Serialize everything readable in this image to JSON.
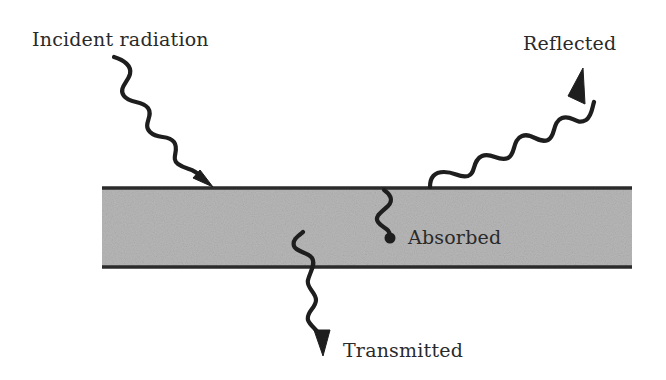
{
  "diagram": {
    "labels": {
      "incident": "Incident radiation",
      "reflected": "Reflected",
      "absorbed": "Absorbed",
      "transmitted": "Transmitted"
    },
    "colors": {
      "slab_fill": "#b8b8b8",
      "slab_edge": "#2b2b2b",
      "wave": "#1e1e1e",
      "text": "#2a2a2a",
      "background": "#ffffff"
    }
  }
}
